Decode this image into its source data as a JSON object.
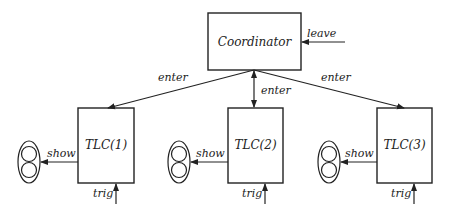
{
  "diagram": {
    "type": "block-diagram",
    "nodes": {
      "coordinator": {
        "label": "Coordinator"
      },
      "tlc1": {
        "label": "TLC(1)"
      },
      "tlc2": {
        "label": "TLC(2)"
      },
      "tlc3": {
        "label": "TLC(3)"
      }
    },
    "edges": {
      "leave": {
        "label": "leave",
        "to": "Coordinator"
      },
      "enter1": {
        "label": "enter",
        "from": "Coordinator",
        "to": "TLC(1)"
      },
      "enter2": {
        "label": "enter",
        "from": "Coordinator",
        "to": "TLC(2)",
        "bidirectional": true
      },
      "enter3": {
        "label": "enter",
        "from": "Coordinator",
        "to": "TLC(3)"
      },
      "show1": {
        "label": "show",
        "from": "TLC(1)",
        "to": "traffic-light-1"
      },
      "show2": {
        "label": "show",
        "from": "TLC(2)",
        "to": "traffic-light-2"
      },
      "show3": {
        "label": "show",
        "from": "TLC(3)",
        "to": "traffic-light-3"
      },
      "trig1": {
        "label": "trig",
        "to": "TLC(1)"
      },
      "trig2": {
        "label": "trig",
        "to": "TLC(2)"
      },
      "trig3": {
        "label": "trig",
        "to": "TLC(3)"
      }
    },
    "colors": {
      "stroke": "#222222",
      "background": "#ffffff"
    }
  }
}
